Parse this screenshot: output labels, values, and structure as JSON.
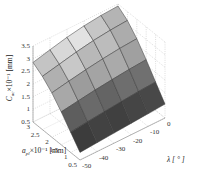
{
  "chart_data": {
    "type": "surface3d",
    "title": "",
    "xlabel": "λ [°]",
    "ylabel": "a_pl ×10⁻¹ [mm]",
    "zlabel": "C_ac ×10⁻¹ [mm]",
    "x_ticks": [
      "-50",
      "-40",
      "-30",
      "-20",
      "-10",
      "0"
    ],
    "y_ticks": [
      "0.5",
      "1",
      "1.5",
      "2",
      "2.5",
      "3"
    ],
    "z_ticks": [
      "0.5",
      "1",
      "1.5",
      "2",
      "2.5",
      "3",
      "3.5"
    ],
    "xlim": [
      -50,
      0
    ],
    "ylim": [
      0.5,
      3
    ],
    "zlim": [
      0.5,
      3.5
    ],
    "grid": true,
    "colormap": "gray",
    "x": [
      -50,
      -40,
      -30,
      -20,
      -10,
      0
    ],
    "y": [
      0.5,
      1,
      1.5,
      2,
      2.5,
      3
    ],
    "z": [
      [
        0.8,
        0.85,
        0.9,
        0.95,
        1.0,
        1.05
      ],
      [
        1.3,
        1.38,
        1.45,
        1.52,
        1.58,
        1.62
      ],
      [
        1.8,
        1.9,
        2.0,
        2.08,
        2.15,
        2.2
      ],
      [
        2.25,
        2.38,
        2.5,
        2.6,
        2.68,
        2.73
      ],
      [
        2.6,
        2.75,
        2.9,
        3.02,
        3.1,
        3.15
      ],
      [
        2.85,
        3.02,
        3.18,
        3.3,
        3.38,
        3.42
      ]
    ],
    "cell_shades": [
      [
        "#3c3c3c",
        "#424242",
        "#404040",
        "#454545",
        "#484848"
      ],
      [
        "#5e5e5e",
        "#6a6a6a",
        "#646464",
        "#6e6e6e",
        "#707070"
      ],
      [
        "#a8a8a8",
        "#9c9c9c",
        "#a4a4a4",
        "#aaaaaa",
        "#a0a0a0"
      ],
      [
        "#b0b0b0",
        "#c8c8c8",
        "#b8b8b8",
        "#bcbcbc",
        "#acacac"
      ],
      [
        "#c4c4c4",
        "#d8d8d8",
        "#e2e2e2",
        "#c6c6c6",
        "#b4b4b4"
      ],
      [
        "#8a8a8a",
        "#6e6e6e",
        "#5c5c5c",
        "#626262",
        "#707070"
      ]
    ]
  },
  "labels": {
    "z_axis": "C",
    "z_axis_sub": "ac",
    "z_axis_rest": "×10⁻¹ [mm]",
    "y_axis": "a",
    "y_axis_sub": "pl",
    "y_axis_rest": "×10⁻¹ [mm]",
    "x_axis": "λ [ ° ]"
  }
}
